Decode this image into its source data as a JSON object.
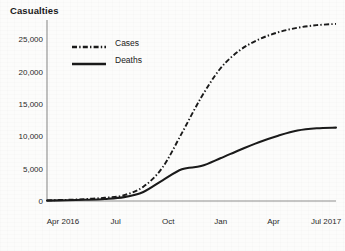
{
  "chart_data": {
    "type": "line",
    "title": "Casualties",
    "xlabel": "",
    "ylabel": "",
    "grid": false,
    "legend_position": "top-left",
    "ylim": [
      0,
      28000
    ],
    "yticks": [
      0,
      5000,
      10000,
      15000,
      20000,
      25000
    ],
    "ytick_labels": [
      "0",
      "5,000",
      "10,000",
      "15,000",
      "20,000",
      "25,000"
    ],
    "xtick_labels": [
      "Apr 2016",
      "Jul",
      "Oct",
      "Jan",
      "Apr",
      "Jul 2017"
    ],
    "x": [
      "Apr 2016",
      "May 2016",
      "Jun 2016",
      "Jul 2016",
      "Aug 2016",
      "Sep 2016",
      "Oct 2016",
      "Nov 2016",
      "Dec 2016",
      "Jan 2017",
      "Feb 2017",
      "Mar 2017",
      "Apr 2017",
      "May 2017",
      "Jun 2017",
      "Jul 2017"
    ],
    "series": [
      {
        "name": "Cases",
        "style": "dash-dot",
        "color": "#1a1a1a",
        "values": [
          100,
          180,
          300,
          500,
          900,
          2200,
          5200,
          10500,
          16000,
          20500,
          23300,
          25000,
          26100,
          26800,
          27200,
          27400
        ]
      },
      {
        "name": "Deaths",
        "style": "solid",
        "color": "#1a1a1a",
        "values": [
          60,
          110,
          190,
          320,
          600,
          1400,
          3200,
          4900,
          5400,
          6600,
          7900,
          9100,
          10100,
          10900,
          11250,
          11350
        ]
      }
    ]
  },
  "legend": {
    "items": [
      {
        "label": "Cases",
        "style": "dash-dot"
      },
      {
        "label": "Deaths",
        "style": "solid"
      }
    ]
  },
  "axes": {
    "axis_color": "#8d8d8d"
  }
}
